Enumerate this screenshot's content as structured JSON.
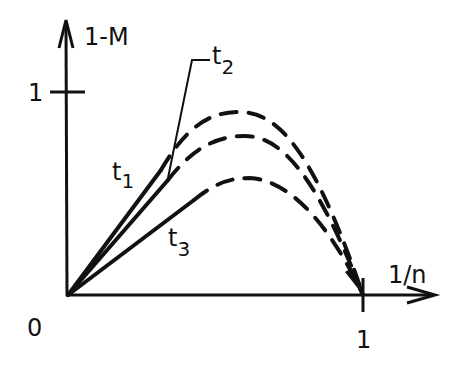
{
  "figure": {
    "type": "schematic_curves",
    "y_axis": {
      "label": "1-M",
      "tick_label": "1"
    },
    "x_axis": {
      "label": "1/n",
      "tick_label": "1"
    },
    "origin_label": "0",
    "curves": [
      {
        "name": "t1",
        "label": "t",
        "subscript": "1"
      },
      {
        "name": "t2",
        "label": "t",
        "subscript": "2"
      },
      {
        "name": "t3",
        "label": "t",
        "subscript": "3"
      }
    ],
    "colors": {
      "ink": "#111111",
      "background": "#ffffff"
    }
  }
}
